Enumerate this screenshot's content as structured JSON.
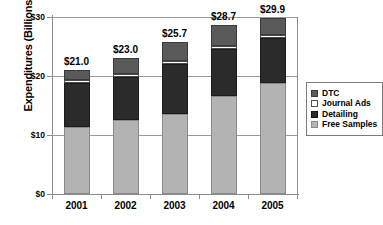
{
  "chart_data": {
    "type": "bar",
    "stacked": true,
    "title": "",
    "xlabel": "",
    "ylabel": "Expenditures (Billions)",
    "categories": [
      "2001",
      "2002",
      "2003",
      "2004",
      "2005"
    ],
    "ylim": [
      0,
      30
    ],
    "yticks": [
      0,
      10,
      20,
      30
    ],
    "ytick_labels": [
      "$0",
      "$10",
      "$20",
      "$30"
    ],
    "grid": true,
    "legend_position": "right",
    "series": [
      {
        "name": "Free Samples",
        "values": [
          11.4,
          12.6,
          13.6,
          16.6,
          18.9
        ]
      },
      {
        "name": "Detailing",
        "values": [
          7.4,
          7.2,
          8.4,
          8.0,
          7.5
        ]
      },
      {
        "name": "Journal Ads",
        "values": [
          0.5,
          0.5,
          0.5,
          0.5,
          0.5
        ]
      },
      {
        "name": "DTC",
        "values": [
          1.7,
          2.7,
          3.2,
          3.6,
          3.0
        ]
      }
    ],
    "totals": [
      21.0,
      23.0,
      25.7,
      28.7,
      29.9
    ],
    "total_labels": [
      "$21.0",
      "$23.0",
      "$25.7",
      "$28.7",
      "$29.9"
    ],
    "series_colors": {
      "DTC": "#5a5a5a",
      "Journal Ads": "#ffffff",
      "Detailing": "#2b2b2b",
      "Free Samples": "#b3b3b3"
    }
  },
  "legend": {
    "items": [
      {
        "label": "DTC",
        "icon": "legend-swatch-dtc"
      },
      {
        "label": "Journal Ads",
        "icon": "legend-swatch-journal-ads"
      },
      {
        "label": "Detailing",
        "icon": "legend-swatch-detailing"
      },
      {
        "label": "Free Samples",
        "icon": "legend-swatch-free-samples"
      }
    ]
  }
}
